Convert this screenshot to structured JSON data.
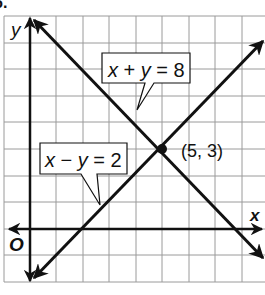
{
  "figure": {
    "number_label": "6.",
    "axes": {
      "x_label": "x",
      "y_label": "y",
      "origin_label": "O"
    },
    "grid": {
      "x_min": -1,
      "x_max": 9,
      "y_min": -2,
      "y_max": 8,
      "step": 1
    },
    "lines": [
      {
        "equation": "x + y = 8",
        "label_parts": [
          "x",
          " + ",
          "y",
          " = 8"
        ]
      },
      {
        "equation": "x − y = 2",
        "label_parts": [
          "x",
          " − ",
          "y",
          " = 2"
        ]
      }
    ],
    "intersection": {
      "label": "(5, 3)",
      "x": 5,
      "y": 3
    },
    "colors": {
      "grid": "#9a9a9a",
      "lines": "#111111",
      "background": "#ffffff"
    }
  }
}
